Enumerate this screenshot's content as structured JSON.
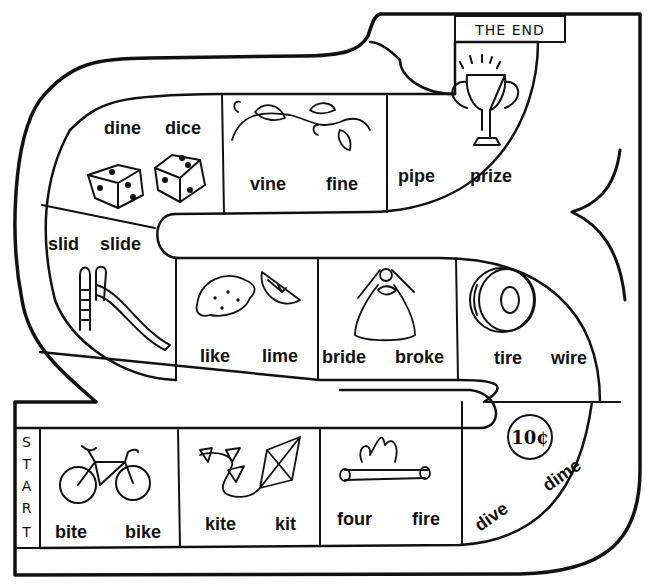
{
  "game": {
    "title": "Long i word game board",
    "start_label": [
      "S",
      "T",
      "A",
      "R",
      "T"
    ],
    "end_label": "THE END",
    "colors": {
      "ink": "#111111",
      "paper": "#ffffff"
    }
  },
  "spaces": [
    {
      "id": "bike",
      "words": [
        "bite",
        "bike"
      ],
      "picture": "bicycle-icon"
    },
    {
      "id": "kite",
      "words": [
        "kite",
        "kit"
      ],
      "picture": "kite-icon"
    },
    {
      "id": "fire",
      "words": [
        "four",
        "fire"
      ],
      "picture": "campfire-icon"
    },
    {
      "id": "dime",
      "words": [
        "dive",
        "dime"
      ],
      "picture": "dime-coin-icon",
      "coin_text": "10¢"
    },
    {
      "id": "tire",
      "words": [
        "tire",
        "wire"
      ],
      "picture": "tire-icon"
    },
    {
      "id": "bride",
      "words": [
        "bride",
        "broke"
      ],
      "picture": "bride-icon"
    },
    {
      "id": "lime",
      "words": [
        "like",
        "lime"
      ],
      "picture": "lemon-lime-icon"
    },
    {
      "id": "slide",
      "words": [
        "slid",
        "slide"
      ],
      "picture": "playground-slide-icon"
    },
    {
      "id": "dice",
      "words": [
        "dine",
        "dice"
      ],
      "picture": "dice-icon"
    },
    {
      "id": "vine",
      "words": [
        "vine",
        "fine"
      ],
      "picture": "vine-icon"
    },
    {
      "id": "prize",
      "words": [
        "pipe",
        "prize"
      ],
      "picture": "trophy-icon"
    }
  ]
}
